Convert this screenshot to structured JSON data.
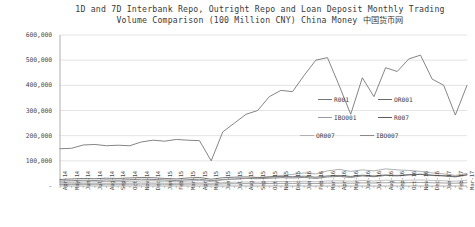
{
  "chart_data": {
    "type": "line",
    "title": "1D and 7D Interbank Repo, Outright Repo and Loan Deposit Monthly Trading\nVolume Comparison (100 Million CNY) China Money 中国货币网",
    "xlabel": "",
    "ylabel": "",
    "ylim": [
      0,
      600000
    ],
    "yticks": [
      0,
      100000,
      200000,
      300000,
      400000,
      500000,
      600000
    ],
    "ytick_labels": [
      "-",
      "100,000",
      "200,000",
      "300,000",
      "400,000",
      "500,000",
      "600,000"
    ],
    "grid": true,
    "legend_position": "center-right-inside",
    "categories": [
      "Apr-14",
      "May-14",
      "Jun-14",
      "Jul-14",
      "Aug-14",
      "Sep-14",
      "Oct-14",
      "Nov-14",
      "Dec-14",
      "Jan-15",
      "Feb-15",
      "Mar-15",
      "Apr-15",
      "May-15",
      "Jun-15",
      "Jul-15",
      "Aug-15",
      "Sep-15",
      "Oct-15",
      "Nov-15",
      "Dec-15",
      "Jan-16",
      "Feb-16",
      "Mar-16",
      "Apr-16",
      "May-16",
      "Jun-16",
      "Jul-16",
      "Aug-16",
      "Sep-16",
      "Oct-16",
      "Nov-16",
      "Dec-16",
      "Jan-17",
      "Feb-17",
      "Mar-17"
    ],
    "series": [
      {
        "name": "R001",
        "color": "#777777",
        "values": [
          148000,
          150000,
          163000,
          165000,
          160000,
          162000,
          160000,
          175000,
          182000,
          178000,
          185000,
          182000,
          180000,
          100000,
          215000,
          250000,
          285000,
          300000,
          355000,
          380000,
          375000,
          440000,
          500000,
          510000,
          400000,
          285000,
          430000,
          355000,
          470000,
          455000,
          505000,
          520000,
          425000,
          400000,
          282000,
          400000
        ]
      },
      {
        "name": "OR001",
        "color": "#6a6a6a",
        "values": [
          20000,
          21000,
          23000,
          22000,
          24000,
          23000,
          25000,
          27000,
          26000,
          24000,
          22000,
          25000,
          27000,
          21000,
          26000,
          28000,
          30000,
          29000,
          31000,
          33000,
          32000,
          34000,
          30000,
          36000,
          38000,
          34000,
          40000,
          37000,
          42000,
          40000,
          44000,
          46000,
          42000,
          40000,
          36000,
          44000
        ]
      },
      {
        "name": "IBO001",
        "color": "#9a9a9a",
        "values": [
          14000,
          15000,
          16000,
          17000,
          18000,
          17000,
          19000,
          20000,
          21000,
          19000,
          17000,
          20000,
          22000,
          18000,
          24000,
          27000,
          30000,
          32000,
          36000,
          42000,
          46000,
          52000,
          48000,
          60000,
          66000,
          58000,
          64000,
          60000,
          68000,
          64000,
          62000,
          58000,
          52000,
          48000,
          42000,
          50000
        ]
      },
      {
        "name": "R007",
        "color": "#5a5a5a",
        "values": [
          26000,
          28000,
          30000,
          29000,
          31000,
          30000,
          32000,
          34000,
          33000,
          30000,
          28000,
          32000,
          34000,
          27000,
          33000,
          35000,
          36000,
          34000,
          36000,
          38000,
          37000,
          39000,
          35000,
          40000,
          42000,
          38000,
          43000,
          40000,
          44000,
          42000,
          45000,
          47000,
          43000,
          41000,
          38000,
          45000
        ]
      },
      {
        "name": "OR007",
        "color": "#b0b0b0",
        "values": [
          9000,
          9500,
          10000,
          10500,
          11000,
          10500,
          11500,
          12000,
          12500,
          11000,
          10000,
          12000,
          13000,
          10500,
          13500,
          15000,
          16000,
          15500,
          17000,
          18000,
          17500,
          19000,
          17000,
          20000,
          21000,
          19000,
          22000,
          20000,
          23000,
          21500,
          23000,
          24000,
          22000,
          21000,
          19000,
          23000
        ]
      },
      {
        "name": "IBO007",
        "color": "#888888",
        "values": [
          6000,
          6200,
          6500,
          6800,
          7000,
          6800,
          7200,
          7500,
          7800,
          7000,
          6500,
          7500,
          8000,
          6800,
          8500,
          9000,
          9500,
          9200,
          10000,
          10500,
          10200,
          11000,
          9800,
          11500,
          12000,
          11000,
          12500,
          11800,
          13000,
          12500,
          13200,
          13800,
          12800,
          12000,
          11000,
          13000
        ]
      }
    ],
    "legend_entries": [
      "R001",
      "OR001",
      "IBO001",
      "R007",
      "OR007",
      "IBO007"
    ]
  }
}
